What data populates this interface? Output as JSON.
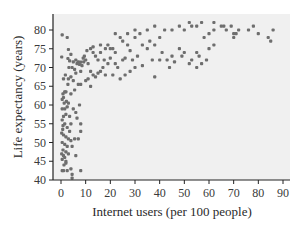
{
  "chart_data": {
    "type": "scatter",
    "title": "",
    "xlabel": "Internet users (per 100 people)",
    "ylabel": "Life expectancy (years)",
    "xlim": [
      0,
      90
    ],
    "ylim": [
      40,
      83
    ],
    "xticks": [
      0,
      10,
      20,
      30,
      40,
      50,
      60,
      70,
      80,
      90
    ],
    "yticks": [
      40,
      45,
      50,
      55,
      60,
      65,
      70,
      75,
      80
    ],
    "grid": false,
    "legend": null,
    "colors": {
      "background": "#f0f0f0",
      "point": "#6e6e6e",
      "axis": "#222222"
    },
    "points": [
      [
        0.5,
        78.7
      ],
      [
        2.5,
        78
      ],
      [
        0.3,
        72.8
      ],
      [
        3,
        74.8
      ],
      [
        4,
        73.5
      ],
      [
        2.8,
        72.4
      ],
      [
        3.5,
        71.8
      ],
      [
        5,
        71.5
      ],
      [
        6,
        72
      ],
      [
        7,
        71.5
      ],
      [
        7.5,
        70.8
      ],
      [
        8,
        71.4
      ],
      [
        8.5,
        70.5
      ],
      [
        9,
        72.5
      ],
      [
        9.2,
        71.5
      ],
      [
        10,
        72
      ],
      [
        6.5,
        71
      ],
      [
        4.5,
        70
      ],
      [
        5.5,
        69.5
      ],
      [
        8,
        69
      ],
      [
        6,
        68.5
      ],
      [
        4,
        67.5
      ],
      [
        3,
        67
      ],
      [
        5,
        66.5
      ],
      [
        7,
        65.5
      ],
      [
        8,
        65.5
      ],
      [
        10,
        66.5
      ],
      [
        12,
        65
      ],
      [
        11,
        67
      ],
      [
        13,
        68
      ],
      [
        14,
        67.5
      ],
      [
        15,
        68.5
      ],
      [
        16,
        69
      ],
      [
        17,
        70
      ],
      [
        18,
        68
      ],
      [
        15,
        72
      ],
      [
        14,
        73
      ],
      [
        13,
        74
      ],
      [
        12,
        75
      ],
      [
        13,
        75.5
      ],
      [
        16,
        74
      ],
      [
        18,
        75
      ],
      [
        19,
        76
      ],
      [
        20,
        75
      ],
      [
        22,
        74
      ],
      [
        20,
        72.5
      ],
      [
        19,
        71
      ],
      [
        22,
        71
      ],
      [
        25,
        72
      ],
      [
        23,
        70
      ],
      [
        21,
        68
      ],
      [
        24,
        67
      ],
      [
        26,
        68
      ],
      [
        28,
        69
      ],
      [
        30,
        70
      ],
      [
        29,
        72
      ],
      [
        31,
        73
      ],
      [
        28,
        74.5
      ],
      [
        27,
        76
      ],
      [
        25,
        77
      ],
      [
        24,
        78
      ],
      [
        22,
        79
      ],
      [
        30,
        78
      ],
      [
        32,
        79
      ],
      [
        33,
        76
      ],
      [
        35,
        75
      ],
      [
        36,
        77
      ],
      [
        38,
        76
      ],
      [
        40,
        78
      ],
      [
        42,
        80
      ],
      [
        40,
        72
      ],
      [
        43,
        72
      ],
      [
        44,
        70
      ],
      [
        45,
        73
      ],
      [
        48,
        75
      ],
      [
        50,
        74
      ],
      [
        52,
        71
      ],
      [
        53,
        72
      ],
      [
        55,
        74
      ],
      [
        55,
        70
      ],
      [
        56,
        73
      ],
      [
        57,
        71
      ],
      [
        59,
        72
      ],
      [
        60,
        75
      ],
      [
        62,
        80
      ],
      [
        62,
        76
      ],
      [
        45,
        80
      ],
      [
        48,
        81
      ],
      [
        50,
        80
      ],
      [
        52,
        82
      ],
      [
        53,
        81
      ],
      [
        55,
        81
      ],
      [
        57,
        82
      ],
      [
        58,
        78
      ],
      [
        60,
        79
      ],
      [
        62,
        82
      ],
      [
        65,
        81
      ],
      [
        66,
        81
      ],
      [
        67,
        80
      ],
      [
        69,
        81
      ],
      [
        70,
        79
      ],
      [
        70,
        78
      ],
      [
        71,
        79
      ],
      [
        72,
        80
      ],
      [
        76,
        80
      ],
      [
        78,
        81
      ],
      [
        80,
        79
      ],
      [
        84,
        78
      ],
      [
        85,
        77
      ],
      [
        86,
        80
      ],
      [
        35,
        80
      ],
      [
        38,
        81
      ],
      [
        30,
        80
      ],
      [
        27,
        79
      ],
      [
        1,
        67
      ],
      [
        1.5,
        63.5
      ],
      [
        0.8,
        63
      ],
      [
        2,
        63.5
      ],
      [
        1,
        62
      ],
      [
        0.5,
        61.5
      ],
      [
        3,
        60.5
      ],
      [
        2.5,
        59.5
      ],
      [
        0.5,
        59
      ],
      [
        1.5,
        59
      ],
      [
        5,
        59
      ],
      [
        6,
        58
      ],
      [
        1,
        57
      ],
      [
        0.5,
        56
      ],
      [
        2,
        57.5
      ],
      [
        3.5,
        57
      ],
      [
        6.5,
        56.5
      ],
      [
        1.5,
        55
      ],
      [
        0.8,
        54.5
      ],
      [
        2.5,
        54
      ],
      [
        0.3,
        52.5
      ],
      [
        1,
        52
      ],
      [
        2,
        51.5
      ],
      [
        3,
        51
      ],
      [
        4,
        50.5
      ],
      [
        5.5,
        51
      ],
      [
        7,
        51
      ],
      [
        8,
        53
      ],
      [
        0.5,
        50
      ],
      [
        1.5,
        49.5
      ],
      [
        2.5,
        49
      ],
      [
        0.8,
        48
      ],
      [
        2,
        47.5
      ],
      [
        3,
        47
      ],
      [
        0.3,
        47
      ],
      [
        1,
        46.5
      ],
      [
        1.5,
        46
      ],
      [
        0.5,
        45.5
      ],
      [
        2,
        45
      ],
      [
        6,
        46.5
      ],
      [
        4.5,
        49
      ],
      [
        3.5,
        53
      ],
      [
        4,
        55
      ],
      [
        8,
        55
      ],
      [
        7.5,
        60
      ],
      [
        0.5,
        42.5
      ],
      [
        1,
        42.5
      ],
      [
        2.5,
        42.5
      ],
      [
        4,
        43
      ],
      [
        4.5,
        41.5
      ],
      [
        4.5,
        40.5
      ],
      [
        8,
        42.5
      ],
      [
        2,
        44.5
      ],
      [
        1.2,
        44
      ],
      [
        0.7,
        53.5
      ],
      [
        1.3,
        60.5
      ],
      [
        2.2,
        61
      ],
      [
        4,
        63
      ],
      [
        5.5,
        64
      ],
      [
        2.8,
        65.5
      ],
      [
        1.8,
        68
      ],
      [
        3.2,
        70
      ],
      [
        9.5,
        73
      ],
      [
        11,
        71
      ],
      [
        12,
        69
      ],
      [
        10.5,
        74.5
      ],
      [
        16,
        76
      ],
      [
        17.5,
        72
      ],
      [
        21,
        75
      ],
      [
        26,
        72.5
      ],
      [
        33,
        70.5
      ],
      [
        38,
        67.5
      ],
      [
        37,
        72
      ],
      [
        41,
        74
      ],
      [
        46,
        71.5
      ],
      [
        49,
        73
      ]
    ]
  },
  "axes": {
    "x_title": "Internet users (per 100 people)",
    "y_title": "Life expectancy (years)",
    "x_tick_labels": [
      "0",
      "10",
      "20",
      "30",
      "40",
      "50",
      "60",
      "70",
      "80",
      "90"
    ],
    "y_tick_labels": [
      "40",
      "45",
      "50",
      "55",
      "60",
      "65",
      "70",
      "75",
      "80"
    ]
  }
}
